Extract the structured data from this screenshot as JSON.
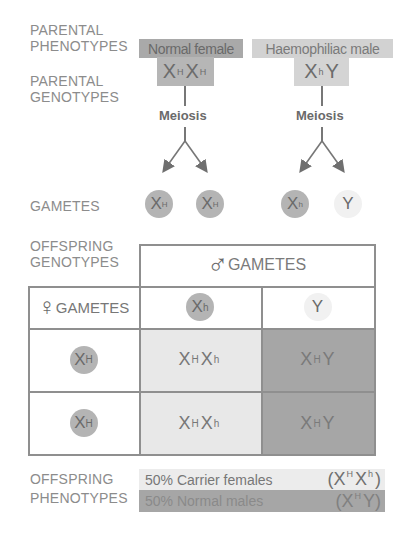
{
  "diagram": {
    "colors": {
      "label_text": "#8c8c8c",
      "dark_gray_fill": "#a9a9a9",
      "light_gray_fill": "#d2d2d2",
      "pale_fill": "#e8e8e8",
      "grid_line": "#8f8f8f"
    }
  },
  "labels": {
    "parental_phenotypes_1": "PARENTAL",
    "parental_phenotypes_2": "PHENOTYPES",
    "parental_genotypes_1": "PARENTAL",
    "parental_genotypes_2": "GENOTYPES",
    "gametes": "GAMETES",
    "offspring_genotypes_1": "OFFSPRING",
    "offspring_genotypes_2": "GENOTYPES",
    "offspring_phenotypes_1": "OFFSPRING",
    "offspring_phenotypes_2": "PHENOTYPES"
  },
  "parents": {
    "female": {
      "phenotype": "Normal female",
      "genotype": [
        {
          "base": "X",
          "allele": "H"
        },
        {
          "base": "X",
          "allele": "H"
        }
      ],
      "meiosis_label": "Meiosis",
      "gametes": [
        {
          "base": "X",
          "allele": "H"
        },
        {
          "base": "X",
          "allele": "H"
        }
      ]
    },
    "male": {
      "phenotype": "Haemophiliac male",
      "genotype": [
        {
          "base": "X",
          "allele": "h"
        },
        {
          "base": "Y",
          "allele": ""
        }
      ],
      "meiosis_label": "Meiosis",
      "gametes": [
        {
          "base": "X",
          "allele": "h"
        },
        {
          "base": "Y",
          "allele": ""
        }
      ]
    }
  },
  "punnett": {
    "male_header_symbol": "♂",
    "male_header_label": "GAMETES",
    "female_header_symbol": "♀",
    "female_header_label": "GAMETES",
    "columns": [
      {
        "base": "X",
        "allele": "h"
      },
      {
        "base": "Y",
        "allele": ""
      }
    ],
    "rows": [
      {
        "gamete": {
          "base": "X",
          "allele": "H"
        },
        "cells": [
          {
            "a": "X",
            "a_sup": "H",
            "b": "X",
            "b_sup": "h"
          },
          {
            "a": "X",
            "a_sup": "H",
            "b": "Y",
            "b_sup": ""
          }
        ]
      },
      {
        "gamete": {
          "base": "X",
          "allele": "H"
        },
        "cells": [
          {
            "a": "X",
            "a_sup": "H",
            "b": "X",
            "b_sup": "h"
          },
          {
            "a": "X",
            "a_sup": "H",
            "b": "Y",
            "b_sup": ""
          }
        ]
      }
    ]
  },
  "offspring_phenotypes": [
    {
      "text": "50% Carrier females",
      "geno_open": "(X",
      "geno_sup1": "H",
      "geno_mid": "X",
      "geno_sup2": "h",
      "geno_close": ")"
    },
    {
      "text": "50% Normal males",
      "geno_open": "(X",
      "geno_sup1": "H",
      "geno_mid": "Y",
      "geno_sup2": "",
      "geno_close": ")"
    }
  ]
}
